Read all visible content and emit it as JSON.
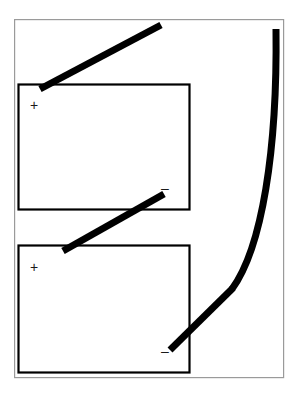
{
  "figure": {
    "background_color": "#ffffff",
    "stroke_color": "#000000",
    "outer_frame_color": "#9a9a9a",
    "box_border_color": "#000000",
    "thick_line_color": "#000000"
  },
  "outer_frame": {
    "name": "outer-frame",
    "x": 14,
    "y": 19,
    "width": 270,
    "height": 359,
    "stroke_width": 1.2,
    "color": "#9a9a9a"
  },
  "boxes": [
    {
      "id": "upper-cell",
      "label": "upper cell body",
      "x": 18,
      "y": 84,
      "width": 172,
      "height": 126,
      "stroke_width": 2.2,
      "color": "#000000",
      "terminals": [
        {
          "id": "upper-positive",
          "symbol": "+",
          "polarity": "positive",
          "x": 30,
          "y": 99
        },
        {
          "id": "upper-negative",
          "symbol": "–",
          "polarity": "negative",
          "x": 161,
          "y": 182
        }
      ]
    },
    {
      "id": "lower-cell",
      "label": "lower cell body",
      "x": 18,
      "y": 245,
      "width": 172,
      "height": 128,
      "stroke_width": 2.2,
      "color": "#000000",
      "terminals": [
        {
          "id": "lower-positive",
          "symbol": "+",
          "polarity": "positive",
          "x": 30,
          "y": 261
        },
        {
          "id": "lower-negative",
          "symbol": "–",
          "polarity": "negative",
          "x": 161,
          "y": 345
        }
      ]
    }
  ],
  "conductors": [
    {
      "id": "top-lead",
      "label": "top diagonal lead",
      "type": "line",
      "x1": 40,
      "y1": 89,
      "x2": 161,
      "y2": 25,
      "stroke_width": 7,
      "color": "#000000"
    },
    {
      "id": "interconnect-lead",
      "label": "middle diagonal interconnect",
      "type": "line",
      "x1": 63,
      "y1": 251,
      "x2": 164,
      "y2": 194,
      "stroke_width": 7,
      "color": "#000000"
    },
    {
      "id": "bottom-lead",
      "label": "bottom diagonal lead joining curved conductor",
      "type": "line",
      "x1": 170,
      "y1": 350,
      "x2": 232,
      "y2": 289,
      "stroke_width": 7,
      "color": "#000000"
    },
    {
      "id": "curved-conductor",
      "label": "right curved conductor",
      "type": "curve",
      "start": [
        276,
        29
      ],
      "control_1": [
        277,
        150
      ],
      "control_2": [
        262,
        248
      ],
      "end": [
        232,
        289
      ],
      "stroke_width": 7,
      "color": "#000000"
    }
  ]
}
